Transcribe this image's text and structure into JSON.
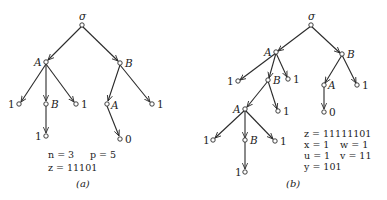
{
  "diagrams": {
    "a": {
      "caption": "(a)",
      "root_label": "σ",
      "labels": {
        "A1": "A",
        "B1": "B",
        "leaf1": "1",
        "B2": "B",
        "leaf2": "1",
        "leaf3": "1",
        "A2": "A",
        "leaf4": "1",
        "leaf5": "0"
      },
      "equations": {
        "n": "n = 3",
        "p": "p = 5",
        "z": "z = 11101"
      }
    },
    "b": {
      "caption": "(b)",
      "root_label": "σ",
      "labels": {
        "A1": "A",
        "B1": "B",
        "leaf1": "1",
        "B2": "B",
        "leaf2": "1",
        "A3": "A",
        "leaf3": "1",
        "leaf4": "1",
        "B3": "B",
        "leaf5": "1",
        "leaf6": "1",
        "A2": "A",
        "leaf7": "1",
        "leaf8": "0"
      },
      "equations": {
        "z": "z = 11111101",
        "x": "x = 1",
        "w": "w = 1",
        "u": "u = 1",
        "v": "v = 11",
        "y": "y = 101"
      }
    }
  }
}
